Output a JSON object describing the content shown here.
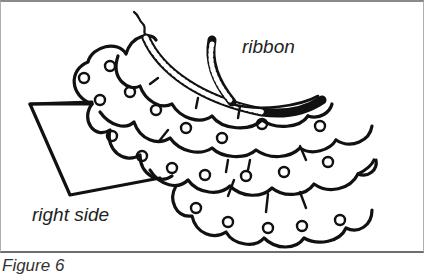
{
  "figure": {
    "labels": {
      "ribbon": "ribbon",
      "right_side": "right side"
    },
    "caption": "Figure 6",
    "colors": {
      "ink": "#111111",
      "background": "#ffffff",
      "border": "#8a8a8a"
    }
  }
}
